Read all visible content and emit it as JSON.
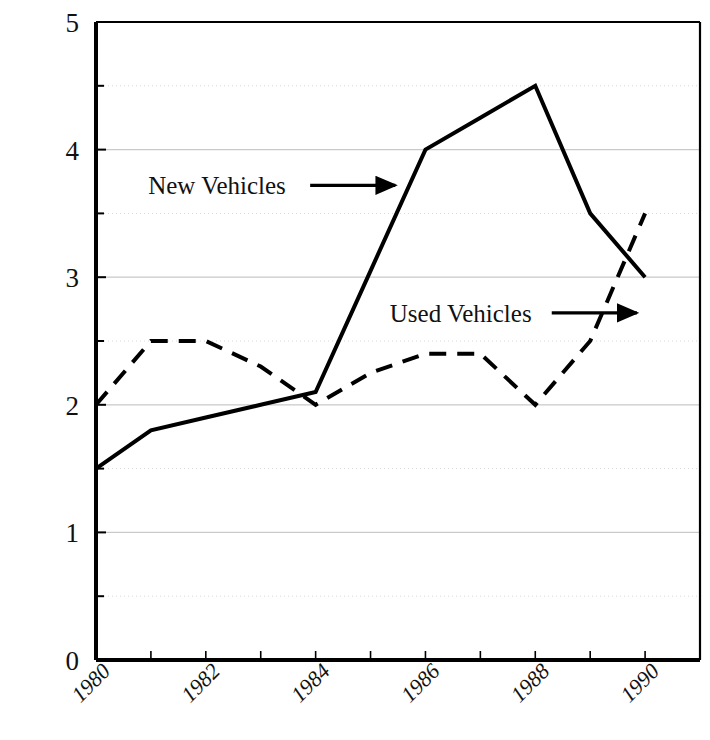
{
  "chart_data": {
    "type": "line",
    "title": "",
    "subtitle": "",
    "xlabel": "",
    "ylabel": "",
    "xlim": [
      1980,
      1991
    ],
    "ylim": [
      0,
      5
    ],
    "grid": true,
    "grid_major_y": [
      0,
      1,
      2,
      3,
      4,
      5
    ],
    "grid_minor_y": [
      0.5,
      1.5,
      2.5,
      3.5,
      4.5
    ],
    "y_tick_labels": [
      "0",
      "1",
      "2",
      "3",
      "4",
      "5"
    ],
    "x": [
      1980,
      1981,
      1982,
      1983,
      1984,
      1985,
      1986,
      1987,
      1988,
      1989,
      1990
    ],
    "x_tick_values": [
      1980,
      1981,
      1982,
      1983,
      1984,
      1985,
      1986,
      1987,
      1988,
      1989,
      1990
    ],
    "x_tick_labels": [
      "1980",
      "",
      "1982",
      "",
      "1984",
      "",
      "1986",
      "",
      "1988",
      "",
      "1990"
    ],
    "x_labels_shown": [
      "1980",
      "1982",
      "1984",
      "1986",
      "1988",
      "1990"
    ],
    "x_label_rotation": -45,
    "legend_position": "inline-annotations",
    "series": [
      {
        "name": "New Vehicles",
        "style": "solid",
        "color": "#000000",
        "values": [
          1.5,
          1.8,
          1.9,
          2.0,
          2.1,
          3.05,
          4.0,
          4.25,
          4.5,
          3.5,
          3.0
        ]
      },
      {
        "name": "Used Vehicles",
        "style": "dashed",
        "color": "#000000",
        "values": [
          2.0,
          2.5,
          2.5,
          2.3,
          2.0,
          2.25,
          2.4,
          2.4,
          2.0,
          2.5,
          3.5
        ]
      }
    ],
    "annotations": [
      {
        "label": "New Vehicles",
        "target_series": "New Vehicles",
        "arrow": "right-arrow",
        "text_x": 1980.95,
        "text_y": 3.72,
        "arrow_from_x": 1983.9,
        "arrow_from_y": 3.72,
        "arrow_to_x": 1985.45,
        "arrow_to_y": 3.72
      },
      {
        "label": "Used Vehicles",
        "target_series": "Used Vehicles",
        "arrow": "right-arrow",
        "text_x": 1985.35,
        "text_y": 2.72,
        "arrow_from_x": 1988.3,
        "arrow_from_y": 2.72,
        "arrow_to_x": 1989.85,
        "arrow_to_y": 2.72
      }
    ],
    "colors": {
      "axis": "#000000",
      "grid_major": "#c9c9c9",
      "grid_minor": "#d8d8d8",
      "line": "#000000",
      "background": "#ffffff"
    }
  }
}
